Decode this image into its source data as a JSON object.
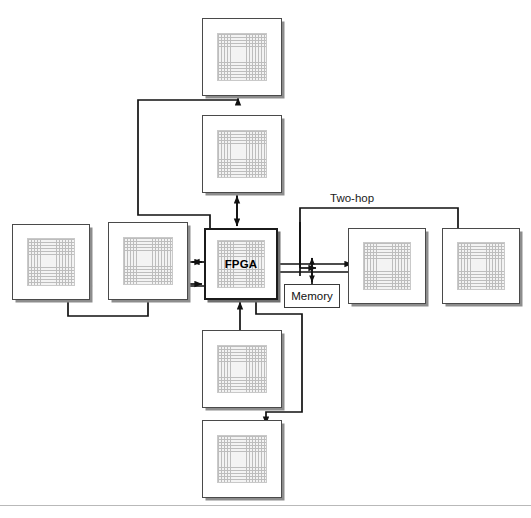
{
  "figure": {
    "type": "block-diagram",
    "background": "#ffffff",
    "width": 531,
    "height": 518
  },
  "colors": {
    "chip_border": "#4a4a4a",
    "core_border": "#1b1b1b",
    "die_fill": "#f3f3f3",
    "die_grid": "#bdbdbd",
    "wire": "#111111",
    "shadow": "#8d8d8d",
    "text": "#000000"
  },
  "nodes": [
    {
      "id": "top",
      "label": "",
      "x": 202,
      "y": 18,
      "w": 80,
      "h": 78
    },
    {
      "id": "upper",
      "label": "",
      "x": 202,
      "y": 115,
      "w": 80,
      "h": 78
    },
    {
      "id": "far-left",
      "label": "",
      "x": 12,
      "y": 224,
      "w": 78,
      "h": 76
    },
    {
      "id": "left",
      "label": "",
      "x": 108,
      "y": 222,
      "w": 80,
      "h": 78
    },
    {
      "id": "fpga",
      "label": "FPGA",
      "x": 204,
      "y": 228,
      "w": 74,
      "h": 72
    },
    {
      "id": "right",
      "label": "",
      "x": 348,
      "y": 228,
      "w": 78,
      "h": 76
    },
    {
      "id": "far-right",
      "label": "",
      "x": 442,
      "y": 228,
      "w": 78,
      "h": 76
    },
    {
      "id": "lower",
      "label": "",
      "x": 202,
      "y": 330,
      "w": 80,
      "h": 78
    },
    {
      "id": "bottom",
      "label": "",
      "x": 202,
      "y": 420,
      "w": 80,
      "h": 78
    }
  ],
  "memory": {
    "label": "Memory",
    "x": 284,
    "y": 284,
    "w": 56,
    "h": 24
  },
  "annotations": [
    {
      "id": "two-hop",
      "text": "Two-hop",
      "x": 330,
      "y": 192
    }
  ],
  "edges": [
    {
      "id": "fpga-to-top",
      "from": "fpga",
      "to": "top",
      "style": "orthogonal",
      "arrow": "single"
    },
    {
      "id": "fpga-upper-bidir",
      "from": "fpga",
      "to": "upper",
      "style": "straight",
      "arrow": "double"
    },
    {
      "id": "fpga-to-left",
      "from": "fpga",
      "to": "left",
      "style": "straight",
      "arrow": "single"
    },
    {
      "id": "fpga-to-farleft",
      "from": "fpga",
      "to": "far-left",
      "style": "orthogonal",
      "arrow": "single"
    },
    {
      "id": "fpga-right-bus",
      "from": "fpga",
      "to": "right",
      "style": "bus",
      "arrow": "diamond-both"
    },
    {
      "id": "fpga-memory",
      "from": "fpga",
      "to": "memory",
      "style": "straight",
      "arrow": "double"
    },
    {
      "id": "lower-to-fpga",
      "from": "lower",
      "to": "fpga",
      "style": "orthogonal",
      "arrow": "single"
    },
    {
      "id": "two-hop-route",
      "from": "fpga",
      "to": "far-right",
      "style": "orthogonal",
      "arrow": "single",
      "label": "Two-hop"
    },
    {
      "id": "bottom-route",
      "from": "fpga",
      "to": "bottom",
      "style": "orthogonal",
      "arrow": "single"
    }
  ],
  "caption": {
    "label": "",
    "text": ""
  }
}
